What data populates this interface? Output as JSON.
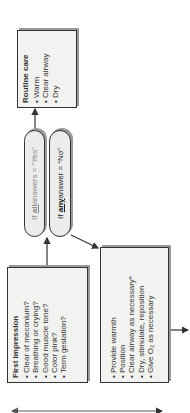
{
  "routine_care": {
    "title": "Routine care",
    "items": [
      "Warm",
      "Clear airway",
      "Dry"
    ]
  },
  "decisions": {
    "yes": {
      "prefix": "If ",
      "keyword": "all",
      "suffix": " answers = “Yes”"
    },
    "no": {
      "prefix": "If ",
      "keyword": "any",
      "suffix": " answer = “No”"
    }
  },
  "first_impression": {
    "title": "First Impression",
    "items": [
      "Clear of meconium?",
      "Breathing or crying?",
      "Good muscle tone?",
      "Color pink?",
      "Term gestation?"
    ]
  },
  "initial_steps": {
    "items": [
      "Provide warmth",
      "Position",
      "Clear airway as necessary*",
      "Dry, stimulate, reposition",
      "Give O₂ as necessary"
    ]
  },
  "colors": {
    "line": "#333333",
    "box_fill": "#f2f2f0",
    "shadow": "#9a9a9a"
  }
}
